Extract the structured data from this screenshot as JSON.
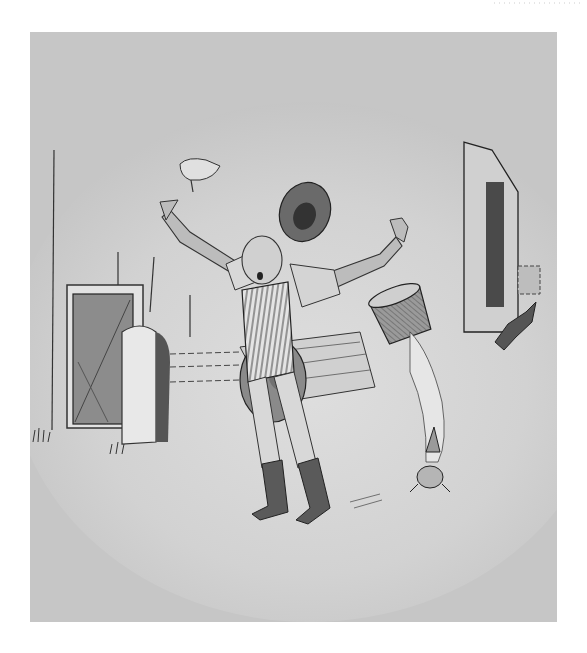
{
  "illustration": {
    "subject": "man startled with arms raised, hat flying off, pail tipping over spilling milk onto a cat, log rolling behind him, barns on left and right, small dog running",
    "style": "pen-and-ink with gray wash",
    "colors": {
      "paper": "#ffffff",
      "background_wash": "#c4c4c4",
      "light_wash": "#d6d6d6",
      "ink": "#222222",
      "mid_gray": "#8a8a8a",
      "dark_gray": "#4a4a4a"
    },
    "elements": [
      "flying-chicken",
      "flying-hat",
      "man",
      "striped-vest",
      "boots",
      "log",
      "pail",
      "spilled-milk",
      "cat",
      "dog",
      "left-barn-door",
      "post",
      "right-barn"
    ]
  }
}
